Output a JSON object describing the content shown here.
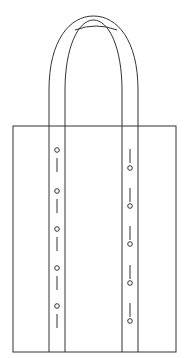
{
  "figure": {
    "stroke_color": "#333333",
    "background": "#ffffff",
    "body": {
      "x": 13,
      "y": 126,
      "width": 163,
      "height": 226
    },
    "straps": [
      {
        "name": "left",
        "x1": 49,
        "x2": 65,
        "hole_x": 57
      },
      {
        "name": "right",
        "x1": 122,
        "x2": 138,
        "hole_x": 130
      }
    ],
    "left_holes_y": [
      150,
      191,
      229,
      268,
      306
    ],
    "left_slots": [
      [
        158,
        172
      ],
      [
        199,
        213
      ],
      [
        237,
        251
      ],
      [
        276,
        290
      ],
      [
        314,
        328
      ]
    ],
    "right_holes_y": [
      168,
      206,
      244,
      283,
      321
    ],
    "right_slots": [
      [
        149,
        163
      ],
      [
        188,
        202
      ],
      [
        226,
        240
      ],
      [
        265,
        279
      ],
      [
        303,
        317
      ]
    ]
  }
}
